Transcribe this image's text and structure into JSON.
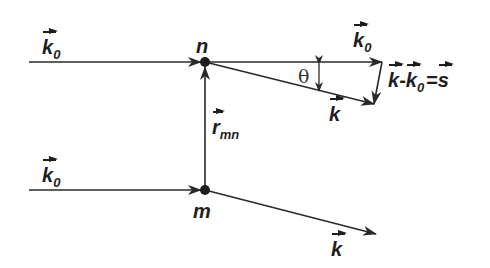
{
  "diagram": {
    "type": "scattering-vector-diagram",
    "nodes": [
      {
        "id": "n",
        "label": "n",
        "x": 205,
        "y": 62
      },
      {
        "id": "m",
        "label": "m",
        "x": 205,
        "y": 190
      }
    ],
    "labels": {
      "incident_top": {
        "main": "k",
        "sub": "0"
      },
      "incident_bottom": {
        "main": "k",
        "sub": "0"
      },
      "transmitted_top_k0": {
        "main": "k",
        "sub": "0"
      },
      "scattered_top": {
        "main": "k"
      },
      "scattered_bottom": {
        "main": "k"
      },
      "separation": {
        "main": "r",
        "sub": "mn"
      },
      "angle": "θ",
      "equation": {
        "k": "k",
        "minus": "-",
        "k0_main": "k",
        "k0_sub": "0",
        "equals": "=",
        "s": "s"
      }
    },
    "colors": {
      "stroke": "#2a2a2a",
      "text": "#1e1e1e",
      "background": "#ffffff"
    }
  }
}
